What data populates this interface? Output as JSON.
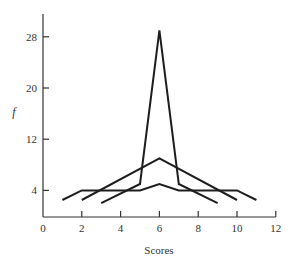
{
  "chart_data": {
    "type": "line",
    "title": "",
    "xlabel": "Scores",
    "ylabel": "f",
    "xlim": [
      0,
      12
    ],
    "ylim": [
      0,
      30
    ],
    "x_ticks": [
      0,
      2,
      4,
      6,
      8,
      10,
      12
    ],
    "y_ticks": [
      4,
      12,
      20,
      28
    ],
    "grid": false,
    "legend": null,
    "series": [
      {
        "name": "Flat distribution",
        "points": [
          [
            1,
            2.5
          ],
          [
            2,
            4
          ],
          [
            5,
            4
          ],
          [
            6,
            5
          ],
          [
            7,
            4
          ],
          [
            10,
            4
          ],
          [
            11,
            2.5
          ]
        ]
      },
      {
        "name": "Moderate peak",
        "points": [
          [
            2,
            2.5
          ],
          [
            6,
            9
          ],
          [
            10,
            2.5
          ]
        ]
      },
      {
        "name": "Sharp peak",
        "points": [
          [
            3,
            2
          ],
          [
            5,
            5
          ],
          [
            6,
            29
          ],
          [
            7,
            5
          ],
          [
            9,
            2
          ]
        ]
      }
    ]
  },
  "axes": {
    "x_label": "Scores",
    "y_label": "f",
    "x_tick_labels": [
      "0",
      "2",
      "4",
      "6",
      "8",
      "10",
      "12"
    ],
    "y_tick_labels": [
      "4",
      "12",
      "20",
      "28"
    ]
  }
}
